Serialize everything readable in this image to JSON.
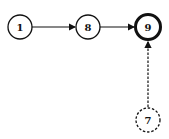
{
  "diagram": {
    "type": "directed-graph",
    "nodes": [
      {
        "id": "1",
        "label": "1",
        "x": 20,
        "y": 27,
        "style": "normal"
      },
      {
        "id": "8",
        "label": "8",
        "x": 88,
        "y": 27,
        "style": "normal"
      },
      {
        "id": "9",
        "label": "9",
        "x": 148,
        "y": 27,
        "style": "bold"
      },
      {
        "id": "7",
        "label": "7",
        "x": 148,
        "y": 120,
        "style": "dashed"
      }
    ],
    "edges": [
      {
        "from": "1",
        "to": "8",
        "style": "solid"
      },
      {
        "from": "8",
        "to": "9",
        "style": "solid"
      },
      {
        "from": "7",
        "to": "9",
        "style": "dashed"
      }
    ]
  }
}
